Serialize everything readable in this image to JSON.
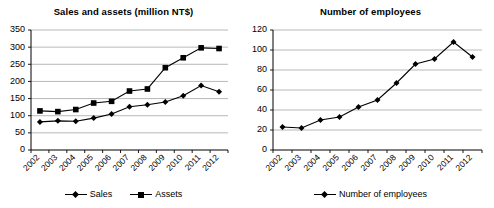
{
  "chart_data": [
    {
      "type": "line",
      "title": "Sales and assets (million NT$)",
      "xlabel": "",
      "ylabel": "",
      "categories": [
        "2002",
        "2003",
        "2004",
        "2005",
        "2006",
        "2007",
        "2008",
        "2009",
        "2010",
        "2011",
        "2012"
      ],
      "ylim": [
        0,
        350
      ],
      "yticks": [
        0,
        50,
        100,
        150,
        200,
        250,
        300,
        350
      ],
      "grid": true,
      "legend_position": "bottom",
      "series": [
        {
          "name": "Sales",
          "marker": "diamond",
          "color": "#000000",
          "values": [
            82,
            85,
            84,
            93,
            105,
            126,
            132,
            140,
            158,
            188,
            170
          ]
        },
        {
          "name": "Assets",
          "marker": "square",
          "color": "#000000",
          "values": [
            114,
            112,
            118,
            137,
            142,
            172,
            178,
            240,
            269,
            298,
            296
          ]
        }
      ]
    },
    {
      "type": "line",
      "title": "Number of employees",
      "xlabel": "",
      "ylabel": "",
      "categories": [
        "2002",
        "2003",
        "2004",
        "2005",
        "2006",
        "2007",
        "2008",
        "2009",
        "2010",
        "2011",
        "2012"
      ],
      "ylim": [
        0,
        120
      ],
      "yticks": [
        0,
        20,
        40,
        60,
        80,
        100,
        120
      ],
      "grid": true,
      "legend_position": "bottom",
      "series": [
        {
          "name": "Number of employees",
          "marker": "diamond",
          "color": "#000000",
          "values": [
            23,
            22,
            30,
            33,
            43,
            50,
            67,
            86,
            91,
            108,
            93
          ]
        }
      ]
    }
  ],
  "panels": [
    {
      "title": "Sales and assets (million NT$)",
      "legend": [
        {
          "label": "Sales",
          "marker": "diamond"
        },
        {
          "label": "Assets",
          "marker": "square"
        }
      ]
    },
    {
      "title": "Number of employees",
      "legend": [
        {
          "label": "Number of employees",
          "marker": "diamond"
        }
      ]
    }
  ],
  "colors": {
    "axis": "#000000",
    "grid": "#a6a6a6",
    "series": "#000000",
    "background": "#ffffff"
  }
}
